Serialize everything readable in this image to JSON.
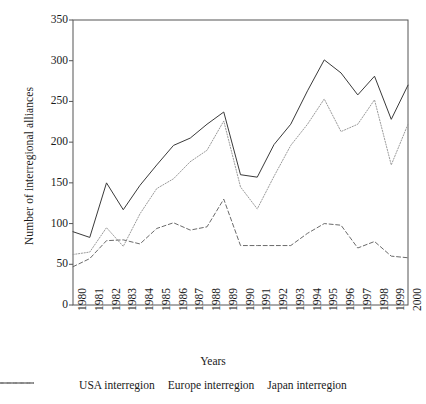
{
  "chart_data": {
    "type": "line",
    "title": "",
    "xlabel": "Years",
    "ylabel": "Number of interregional alliances",
    "x": [
      1980,
      1981,
      1982,
      1983,
      1984,
      1985,
      1986,
      1987,
      1988,
      1989,
      1990,
      1991,
      1992,
      1993,
      1994,
      1995,
      1996,
      1997,
      1998,
      1999,
      2000
    ],
    "xtick_labels": [
      "1980",
      "1981",
      "1982",
      "1983",
      "1984",
      "1985",
      "1986",
      "1987",
      "1988",
      "1989",
      "1990",
      "1991",
      "1992",
      "1993",
      "1994",
      "1995",
      "1996",
      "1997",
      "1998",
      "1999",
      "2000"
    ],
    "ytick_labels": [
      "0",
      "50",
      "100",
      "150",
      "200",
      "250",
      "300",
      "350"
    ],
    "yticks": [
      0,
      50,
      100,
      150,
      200,
      250,
      300,
      350
    ],
    "ylim": [
      0,
      350
    ],
    "xlim": [
      1980,
      2000
    ],
    "grid": false,
    "legend_position": "bottom",
    "series": [
      {
        "name": "USA interregion",
        "style": "solid",
        "color": "#3a3a3a",
        "values": [
          90,
          83,
          150,
          117,
          147,
          172,
          196,
          205,
          222,
          237,
          160,
          157,
          197,
          222,
          263,
          301,
          285,
          258,
          281,
          228,
          270
        ]
      },
      {
        "name": "Europe interregion",
        "style": "dashed",
        "color": "#6a6a6a",
        "values": [
          47,
          57,
          79,
          80,
          75,
          94,
          101,
          92,
          96,
          130,
          73,
          73,
          73,
          73,
          88,
          100,
          98,
          70,
          78,
          60,
          58
        ]
      },
      {
        "name": "Japan interregion",
        "style": "dotted",
        "color": "#9a9a9a",
        "values": [
          62,
          65,
          95,
          72,
          112,
          143,
          155,
          176,
          190,
          226,
          145,
          118,
          158,
          196,
          222,
          253,
          213,
          222,
          252,
          172,
          222
        ]
      }
    ]
  },
  "legend": {
    "items": [
      {
        "label": "USA interregion",
        "swatch": "solid-line-icon"
      },
      {
        "label": "Europe interregion",
        "swatch": "dashed-line-icon"
      },
      {
        "label": "Japan interregion",
        "swatch": "dotted-line-icon"
      }
    ]
  }
}
